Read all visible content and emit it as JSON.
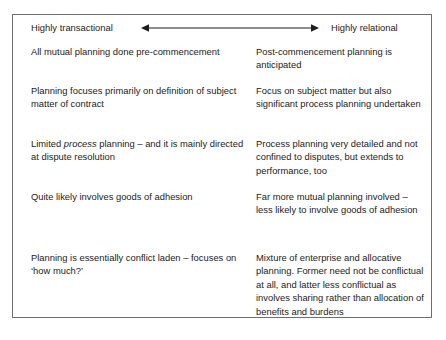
{
  "figure": {
    "spectrum": {
      "left_pole_label": "Highly transactional",
      "right_pole_label": "Highly relational",
      "arrow_icon": "double-headed-horizontal-arrow-icon",
      "arrow_color": "#1c1c1c"
    },
    "border_color": "#6e6e6e",
    "text_color": "#1c1c1c",
    "background_color": "#ffffff",
    "columns": [
      "Highly transactional",
      "Highly relational"
    ],
    "rows": [
      {
        "left": "All mutual planning done pre-commencement",
        "right": "Post-commencement planning is anticipated"
      },
      {
        "left": "Planning focuses primarily on definition of subject matter of contract",
        "right": "Focus on subject matter but also significant process planning undertaken"
      },
      {
        "left_pre_emphasis": "Limited ",
        "left_emphasis": "process",
        "left_post_emphasis": " planning – and it is mainly directed at dispute resolution",
        "right": "Process planning very detailed and not confined to disputes, but extends to performance, too"
      },
      {
        "left": "Quite likely involves goods of adhesion",
        "right": "Far more mutual planning involved – less likely to involve goods of adhesion"
      },
      {
        "left": "Planning is essentially conflict laden – focuses on ‘how much?’",
        "right": "Mixture of enterprise and allocative planning. Former need not be conflictual at all, and latter less conflictual as involves sharing rather than allocation of benefits and burdens"
      }
    ]
  }
}
